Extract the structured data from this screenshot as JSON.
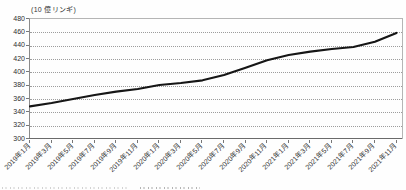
{
  "chart_data": {
    "type": "line",
    "title": "(10 億リンギ)",
    "xlabel": "",
    "ylabel": "",
    "categories": [
      "2019年1月",
      "2019年3月",
      "2019年5月",
      "2019年7月",
      "2019年9月",
      "2019年11月",
      "2020年1月",
      "2020年3月",
      "2020年5月",
      "2020年7月",
      "2020年9月",
      "2020年11月",
      "2021年1月",
      "2021年3月",
      "2021年5月",
      "2021年7月",
      "2021年9月",
      "2021年11月"
    ],
    "values": [
      349,
      354,
      360,
      366,
      371,
      375,
      381,
      384,
      388,
      396,
      407,
      418,
      426,
      431,
      435,
      438,
      446,
      459
    ],
    "ylim": [
      300,
      480
    ],
    "yticks": [
      480,
      460,
      440,
      420,
      400,
      380,
      360,
      340,
      320,
      300
    ],
    "grid": "horizontal-dotted",
    "legend": "none",
    "line_color": "#161616"
  }
}
